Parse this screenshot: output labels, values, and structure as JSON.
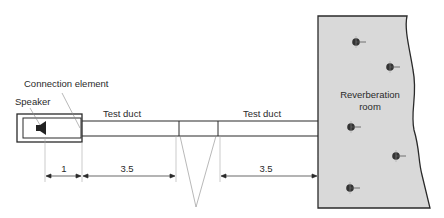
{
  "diagram": {
    "labels": {
      "connection_element": "Connection element",
      "speaker": "Speaker",
      "test_duct_left": "Test duct",
      "test_duct_right": "Test duct",
      "room_line1": "Reverberation",
      "room_line2": "room"
    },
    "dimensions": {
      "speaker_length": "1",
      "duct_left_length": "3.5",
      "duct_right_length": "3.5"
    },
    "colors": {
      "room_fill": "#d9d9d9",
      "line": "#2a2a2a",
      "thin_line": "#8a8a8a",
      "microphone": "#333333"
    },
    "microphones": [
      {
        "x": 356,
        "y": 42
      },
      {
        "x": 390,
        "y": 67
      },
      {
        "x": 351,
        "y": 127
      },
      {
        "x": 396,
        "y": 156
      },
      {
        "x": 350,
        "y": 188
      }
    ]
  }
}
